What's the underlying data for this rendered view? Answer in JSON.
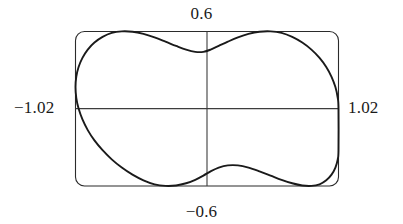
{
  "figure": {
    "name": "polar-peanut-curve-plot",
    "background_color": "#ffffff",
    "curve_color": "#1a1a1a",
    "axis_color": "#3d3d3d",
    "frame_color": "#2b2b2b",
    "label_color": "#1a1a1a"
  },
  "labels": {
    "top": "0.6",
    "bottom": "−0.6",
    "left": "−1.02",
    "right": "1.02"
  },
  "chart_data": {
    "type": "line",
    "title": "",
    "xlabel": "",
    "ylabel": "",
    "xlim": [
      -1.02,
      1.02
    ],
    "ylim": [
      -0.6,
      0.6
    ],
    "grid": false,
    "legend": null,
    "frame": {
      "visible": true,
      "rounded_corners": true
    },
    "axes_lines": {
      "x_axis_at_y": 0,
      "y_axis_at_x": 0,
      "visible": true
    },
    "tick_labels": {
      "x": [
        "-1.02",
        "1.02"
      ],
      "y": [
        "-0.6",
        "0.6"
      ]
    },
    "annotations": [
      {
        "text": "0.6",
        "position": "top-center",
        "value": 0.6
      },
      {
        "text": "-0.6",
        "position": "bottom-center",
        "value": -0.6
      },
      {
        "text": "-1.02",
        "position": "left-middle",
        "value": -1.02
      },
      {
        "text": "1.02",
        "position": "right-middle",
        "value": 1.02
      }
    ],
    "series": [
      {
        "name": "peanut-curve",
        "closed": true,
        "x_extent": [
          -1.02,
          1.02
        ],
        "y_extent": [
          -0.6,
          0.6
        ],
        "waist_half_height": 0.44,
        "lobe_peak_y": 0.6,
        "lobe_peak_x": [
          -0.52,
          0.52
        ],
        "x": [
          1.02,
          1.014,
          0.996,
          0.966,
          0.925,
          0.873,
          0.81,
          0.739,
          0.661,
          0.578,
          0.493,
          0.407,
          0.322,
          0.24,
          0.162,
          0.091,
          0.028,
          -0.028,
          -0.091,
          -0.162,
          -0.24,
          -0.322,
          -0.407,
          -0.493,
          -0.578,
          -0.661,
          -0.739,
          -0.81,
          -0.873,
          -0.925,
          -0.966,
          -0.996,
          -1.014,
          -1.02,
          -1.014,
          -0.996,
          -0.966,
          -0.925,
          -0.873,
          -0.81,
          -0.739,
          -0.661,
          -0.578,
          -0.493,
          -0.407,
          -0.322,
          -0.24,
          -0.162,
          -0.091,
          -0.028,
          0.028,
          0.091,
          0.162,
          0.24,
          0.322,
          0.407,
          0.493,
          0.578,
          0.661,
          0.739,
          0.81,
          0.873,
          0.925,
          0.966,
          0.996,
          1.014,
          1.02
        ],
        "y": [
          0.0,
          0.084,
          0.167,
          0.247,
          0.323,
          0.394,
          0.458,
          0.513,
          0.557,
          0.588,
          0.6,
          0.597,
          0.58,
          0.553,
          0.52,
          0.487,
          0.458,
          0.441,
          0.441,
          0.458,
          0.487,
          0.52,
          0.553,
          0.58,
          0.597,
          0.6,
          0.588,
          0.557,
          0.513,
          0.458,
          0.394,
          0.323,
          0.247,
          0.167,
          0.084,
          0.0,
          -0.084,
          -0.167,
          -0.247,
          -0.323,
          -0.394,
          -0.458,
          -0.513,
          -0.557,
          -0.588,
          -0.6,
          -0.597,
          -0.58,
          -0.553,
          -0.52,
          -0.487,
          -0.458,
          -0.441,
          -0.441,
          -0.458,
          -0.487,
          -0.52,
          -0.553,
          -0.58,
          -0.597,
          -0.6,
          -0.588,
          -0.557,
          -0.513,
          -0.458,
          -0.394,
          -0.323
        ]
      }
    ]
  }
}
